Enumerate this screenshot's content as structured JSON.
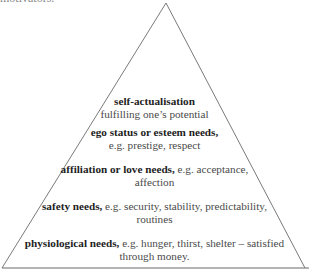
{
  "header": {
    "cutoff_text": "motivators."
  },
  "diagram": {
    "type": "pyramid",
    "outline_color": "#7a7a7a",
    "tiers": [
      {
        "level": 5,
        "heading": "self-actualisation",
        "desc_line1": "",
        "desc_line2": "fulfilling one’s potential"
      },
      {
        "level": 4,
        "heading": "ego status or esteem needs,",
        "desc_line1": "",
        "desc_line2": "e.g. prestige, respect"
      },
      {
        "level": 3,
        "heading": "affiliation or love needs,",
        "desc_line1": " e.g. acceptance,",
        "desc_line2": "affection"
      },
      {
        "level": 2,
        "heading": "safety needs,",
        "desc_line1": " e.g. security, stability, predictability,",
        "desc_line2": "routines"
      },
      {
        "level": 1,
        "heading": "physiological needs,",
        "desc_line1": " e.g. hunger, thirst, shelter – satisfied",
        "desc_line2": "through money."
      }
    ]
  }
}
